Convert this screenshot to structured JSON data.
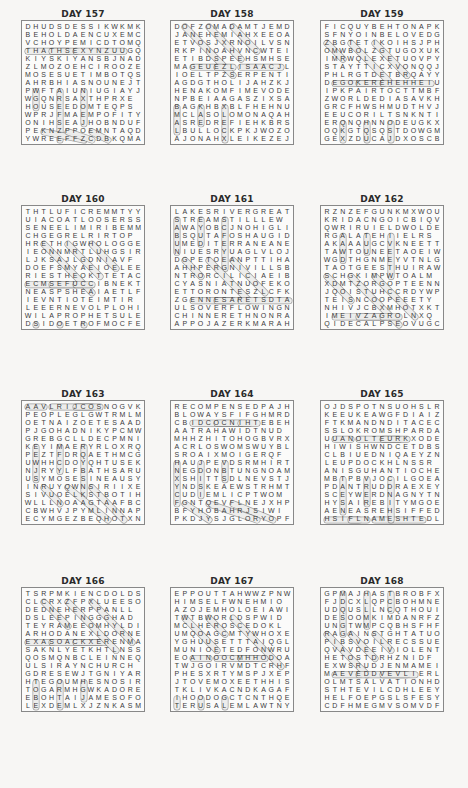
{
  "page": {
    "puzzles": [
      {
        "title": "DAY 157",
        "rows": [
          "DHUDSDESSIKWKMK",
          "BEHOLDAENCUXEMC",
          "VCHOYPEMICDTOMQ",
          "THATHSEXYNZUUGQ",
          "KIYSKIYANSBJNAD",
          "ZLMOZOEHCIROOZE",
          "MOSESUETIMBOTQS",
          "AHRBHIASNOUNEJT",
          "PWFTAIUNIUGIAYJ",
          "WGQNRSAXTHPRXE",
          "HOUSEEDOMTEQPS",
          "WPRJFMAEMPOFITY",
          "ONIHSEAJHOBNDUF",
          "PEKNZPPOEMNTAQD",
          "YWREEFFZCDBKQMA"
        ]
      },
      {
        "title": "DAY 158",
        "rows": [
          "DOFZOMADAMTJEMD",
          "JANEHEMIAHXEEOA",
          "ETVOSJXRNOILVSN",
          "RKPINOAHVNCWTEI",
          "ETIBDSPEEHSMHSE",
          "MAGEUEZLISAACJL",
          "IOELTPZSERPENTI",
          "AGDGTHOLIJAHZKJ",
          "HENAKOMFIMEVODE",
          "NPBEIAAGASZIXSA",
          "BAGKHBXBLFHEHNU",
          "MCLASOLOMONAQAH",
          "ASREDREFIEHKBRS",
          "LBULLOCKPKJWOZO",
          "AJONAHXLEIKEZEJ"
        ]
      },
      {
        "title": "DAY 159",
        "rows": [
          "FICQUYBEHTONAPK",
          "SFNYOINBELOVEDG",
          "ZBGTETIKOIHSJPH",
          "OMWBOLZGTUGOXUK",
          "IMRWQLEXETUOVPY",
          "STAYTTICXVONQQJ",
          "PHLRGTDETBRQAYY",
          "DEGOKEREHEHHEIU",
          "IPKPAIRTOCTTMBF",
          "ZWORLDEDIASAVKH",
          "GRCFHWSHMUDTHVJ",
          "EEUCORILTSNKNTI",
          "ERQNQHNNODEUGKXJ",
          "OQKGTQSQSTDOWGM",
          "GEXZDUCAJDXOSCB"
        ]
      },
      {
        "title": "DAY 160",
        "rows": [
          "THTLUFICREMMTYY",
          "UIACOATLOOSERSS",
          "SENEELIMIRIBEMM",
          "CHGEGRELRIRTOP",
          "HRETHIGWHOLOGGE",
          "IEONNMRTLUHGSIR",
          "LJKSAJLGDNIAVF",
          "DOEFSMYAEIOELEE",
          "RIESTHEOKTTETAC",
          "ECMSEFUCCIBNEKT",
          "NEASPSHEAIAETLF",
          "IEVNTIOTEIMTIR",
          "LEEERNEVOLPLOHI",
          "WILAPROPHETSULE",
          "DSIDOETROFMOCFE"
        ]
      },
      {
        "title": "DAY 161",
        "rows": [
          "LAKESRIVERGREAT",
          "STREAMSTILLLEW",
          "AWAYOBCJNOHIGLI",
          "BSQUTAFOSHAUGID",
          "UMEDITERRANEANE",
          "NIUESRYUAGLVLOJ",
          "DGPETOEANPTTIHA",
          "AHHPERGNIVILLSB",
          "NTRORCILICIAEIB",
          "CYASNIATNUOFEKO",
          "ETTORONTESZLCFK",
          "ZGENNESARETSDTA",
          "ULSOVERFLOWINGN",
          "CHINNERETHNONRA",
          "APPOJAZERKMARAH"
        ]
      },
      {
        "title": "DAY 162",
        "rows": [
          "RZNZEFGUNKMXWOU",
          "KRIDACNGOICBIQV",
          "QWRIRUIELDWOLDE",
          "RGALATEHIIELRS",
          "AKAAAUGCVKNEETT",
          "TAWTOUNEETAOEIW",
          "WGDTHGNMEYVTNLG",
          "TAOTGEESTHUIRAW",
          "SCHGKIMPWTOALM",
          "XDMTZORGOPTEENN",
          "JQOISTUHCCRDYWPI",
          "TEISNCOOPEEETY",
          "NHIVJCBXMHOTXKT",
          "IMEIVZAGROLNXQ",
          "QIDECALPSEOVUGC"
        ]
      },
      {
        "title": "DAY 163",
        "rows": [
          "AAVLRIJCOSNOGVKJ",
          "PEOPLEGLGWTRMLM",
          "OETNAIZOETESAAD",
          "PJGOHADNIKYPCMW",
          "GREBGCLLDECPMNI",
          "KEYIMAERYRLOXRQ",
          "PEZTFDRQAETHMCG",
          "UWHHCDOYQHTUSEK",
          "NJRYYLFBATHSARU",
          "USYMOSESINEAUSY",
          "INRUYQWNSIRIIXE",
          "SIVUOELKSTBOTIH",
          "WLLLNOAAGTAAFBCT",
          "CBWHVJPYMLINNAP",
          "ECYMGEZBEQHOTXN"
        ]
      },
      {
        "title": "DAY 164",
        "rows": [
          "RECOMPENSEDPAJH",
          "BLOWAYSFIFGHMRD",
          "CBIDCOCNIHTEBEHL",
          "AATRAHAWIDTNUD",
          "MHHZHITOHOGBVRX",
          "ACRLOSWOMSWUYBL",
          "SROAIXMOIGERQF",
          "HAUJPEVDSRMHIRT",
          "NEGDONBTUNGNOAML",
          "XSHITTSDLNEVSTJK",
          "YNDSKEAEWSTRHMT",
          "CUDIEMLICPTWOM",
          "FGNTQEVFLNEJXHP",
          "BFYHOBAHRJSIWI",
          "PKDJYSJGLORYOPF"
        ]
      },
      {
        "title": "DAY 165",
        "rows": [
          "OJDSPOTNSUOHSLR",
          "KEEUKEAWGFDIAIZ",
          "FTKMANDNDITACEC",
          "SSLOKROMSHPARDA",
          "UUANOLTEURKXODE",
          "HIWISHWNDCETDBS",
          "CLBIUEDNIQAEYZNA",
          "LEUPDOCKHLNSSR",
          "ANISGUHANTIOCHE",
          "MBTPBVJOCILGOEA",
          "PDANTRUDDRAEXEY",
          "SCEYWERDNAGNYTN",
          "HYSAIREBITYMGOE",
          "AENEASREHSIFFED",
          "HSIFLNAMESHTEDL"
        ]
      },
      {
        "title": "DAY 166",
        "rows": [
          "TSRPMKIENCDOLDS",
          "CLCRXZFPXLUEESO",
          "DEDNEHERPPANLL",
          "DSLEEPINGGGHAD",
          "TEYRAMEEOMHYLDI",
          "ARHODANEXLDORNE",
          "EXASOACKXERENMAR",
          "SAKNLYETKHTLNSS",
          "QOSMQNBCLEINNEQ",
          "ULSIRAYNCHURCH",
          "GDRESEWJTGNIYARP",
          "HTEGOUMHESNOSIRP",
          "TOGARMHGWKADOREN",
          "EBOHTAIJAMESOFO",
          "LEXDEMLXJZNKASM"
        ]
      },
      {
        "title": "DAY 167",
        "rows": [
          "EPPOUTTAHWWZPNW",
          "HIMSELFWNEHMIO",
          "AZOJEMHOLOEIAWI",
          "TWTBWORLDSPWID",
          "MCLHEROSCEDOKL",
          "UMQOAGCMTYWHOXE",
          "YGHUUSETTTAIQGLV",
          "MUNIOETEDFONWRUO",
          "EOAINOOCMHHODOAR",
          "TWJGOIRVMDTCRHF",
          "PHESXRTYMSPJXEPD",
          "JTOVEMOXEETHHIS",
          "TKLIVKACNDKAGAF",
          "IHOODOGCTCNTHQEP",
          "TERUSALEMLAWTNYD"
        ]
      },
      {
        "title": "DAY 168",
        "rows": [
          "GPMAJHASTBROBFX",
          "FJDCXLQPCBOHMNE",
          "UDQUSLLNCQTHOUI",
          "DESOOMKIMDANRFZ",
          "UNGTWMPCQBHSFHF",
          "RAGAINSTGHTATUO",
          "PIBSVOILRECSSUE",
          "QVAVDEEIVIOLENT",
          "HETOSTDRHZNIDF",
          "EXWSRUDJENMAMEI",
          "MAEVEDDVEVLIERL",
          "OLMTSALVATIONHD",
          "STHTEVILCDHLEEY",
          "HELFOEPGSLSFESY",
          "CDFHMEGMVSOMVDF"
        ]
      }
    ]
  }
}
